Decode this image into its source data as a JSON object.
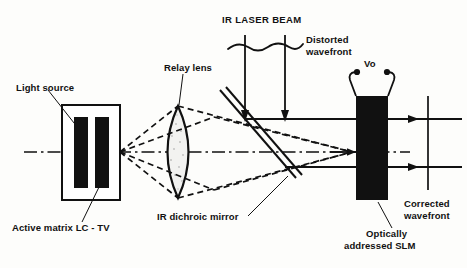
{
  "figure": {
    "type": "optical-system-schematic",
    "title_visible": false,
    "background_color": "#fdfdfb",
    "ink_color": "#111111"
  },
  "labels": {
    "light_source": "Light source",
    "active_matrix": "Active matrix LC - TV",
    "relay_lens": "Relay lens",
    "ir_laser_beam": "IR LASER BEAM",
    "distorted_wavefront_line1": "Distorted",
    "distorted_wavefront_line2": "wavefront",
    "ir_dichroic_mirror": "IR dichroic mirror",
    "vo": "Vo",
    "slm_line1": "Optically",
    "slm_line2": "addressed SLM",
    "corrected_wavefront_line1": "Corrected",
    "corrected_wavefront_line2": "wavefront"
  },
  "components": {
    "lc_tv_panel": {
      "name": "Active matrix LC - TV",
      "shape": "rectangle-with-two-black-bars",
      "fill": "#ffffff",
      "stroke": "#111111"
    },
    "relay_lens": {
      "name": "Relay lens",
      "shape": "biconvex-lens",
      "fill": "#f0f0ee",
      "stroke": "#111111"
    },
    "dichroic_mirror": {
      "name": "IR dichroic mirror",
      "shape": "tilted-double-line",
      "angle_deg": 48,
      "stroke": "#111111"
    },
    "slm": {
      "name": "Optically addressed SLM",
      "shape": "tall-filled-rectangle",
      "fill": "#111111"
    },
    "voltage_source": {
      "name": "Vo",
      "shape": "two-terminal-electrode-leads"
    },
    "corrected_wavefront": {
      "shape": "vertical-straight-line",
      "stroke": "#111111"
    },
    "distorted_wavefront": {
      "shape": "wavy-horizontal-line",
      "stroke": "#111111"
    }
  },
  "beams": {
    "visible_light_rays": {
      "style": "dashed",
      "description": "diverging from LC-TV through relay lens, converging onto SLM"
    },
    "ir_laser_rays": {
      "style": "solid-with-arrowheads",
      "count_incoming": 2,
      "count_outgoing": 2,
      "direction_in": "downward",
      "direction_out": "rightward"
    },
    "optical_axis": {
      "style": "dash-dot",
      "description": "horizontal centreline"
    }
  }
}
